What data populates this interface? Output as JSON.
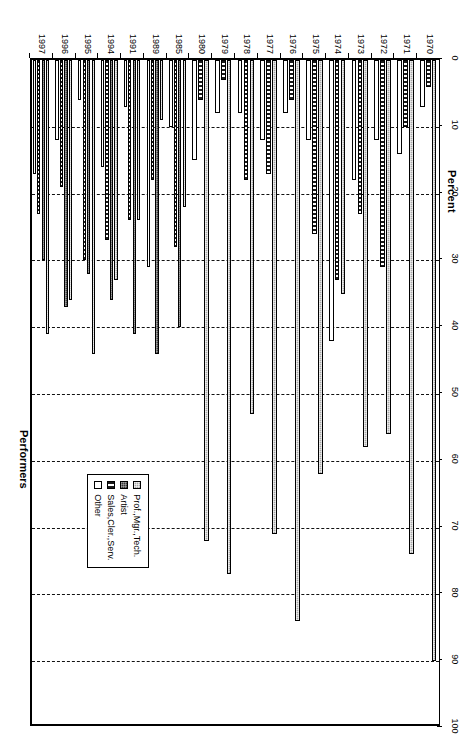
{
  "chart": {
    "title": "Performers",
    "axis_title": "Percent",
    "value_axis": {
      "ticks": [
        0,
        10,
        20,
        30,
        40,
        50,
        60,
        70,
        80,
        90,
        100
      ],
      "min": 0,
      "max": 100,
      "grid": true
    },
    "legend": {
      "position": "bottom-right",
      "entries": [
        {
          "key": "s0",
          "label": "Prof.,Mgr.,Tech."
        },
        {
          "key": "s1",
          "label": "Artist"
        },
        {
          "key": "s2",
          "label": "Sales,Cler.,Serv."
        },
        {
          "key": "s3",
          "label": "Other"
        }
      ]
    }
  },
  "chart_data": {
    "type": "bar",
    "orientation": "horizontal",
    "title": "Performers",
    "xlabel": "Percent",
    "ylabel": "",
    "xlim": [
      0,
      100
    ],
    "grid": true,
    "legend_position": "bottom-right",
    "categories": [
      "1970",
      "1971",
      "1972",
      "1973",
      "1974",
      "1975",
      "1976",
      "1977",
      "1978",
      "1979",
      "1980",
      "1985",
      "1989",
      "1991",
      "1994",
      "1995",
      "1996",
      "1997"
    ],
    "series": [
      {
        "name": "Prof.,Mgr.,Tech.",
        "values": [
          90,
          74,
          56,
          58,
          35,
          62,
          84,
          71,
          53,
          77,
          72,
          22,
          9,
          24,
          33,
          44,
          36,
          41
        ]
      },
      {
        "name": "Artist",
        "values": [
          0,
          0,
          0,
          0,
          0,
          0,
          0,
          0,
          0,
          0,
          0,
          40,
          44,
          41,
          36,
          32,
          37,
          30
        ]
      },
      {
        "name": "Sales,Cler.,Serv.",
        "values": [
          4,
          10,
          31,
          23,
          33,
          26,
          6,
          17,
          18,
          3,
          6,
          28,
          18,
          24,
          27,
          30,
          19,
          23
        ]
      },
      {
        "name": "Other",
        "values": [
          7,
          14,
          12,
          18,
          42,
          12,
          8,
          12,
          8,
          8,
          15,
          10,
          31,
          7,
          16,
          6,
          12,
          17
        ]
      }
    ]
  }
}
